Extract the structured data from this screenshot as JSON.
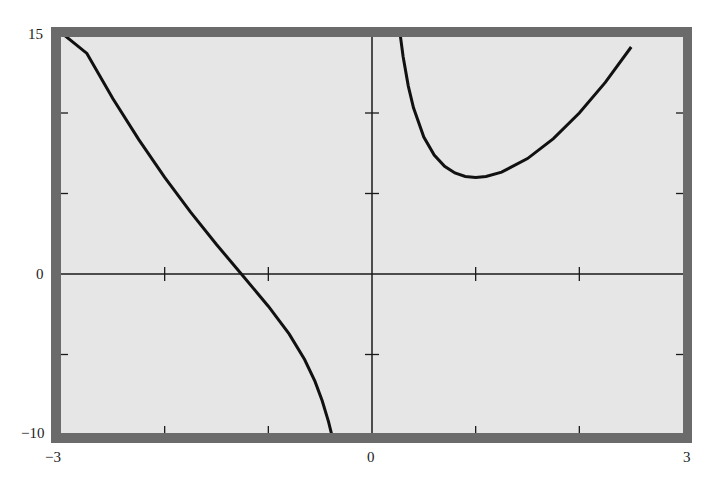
{
  "chart_data": {
    "type": "line",
    "title": "",
    "xlabel": "",
    "ylabel": "",
    "xlim": [
      -3,
      3
    ],
    "ylim": [
      -10,
      15
    ],
    "grid": false,
    "legend": null,
    "x_tick_labels": [
      "-3",
      "0",
      "3"
    ],
    "y_tick_labels": [
      "15",
      "0",
      "-10"
    ],
    "x_minor_ticks": [
      -2,
      -1,
      1,
      2
    ],
    "y_minor_ticks": [
      10,
      5,
      -5
    ],
    "vertical_asymptote": 0,
    "series": [
      {
        "name": "left branch",
        "x": [
          -3.0,
          -2.75,
          -2.5,
          -2.25,
          -2.0,
          -1.75,
          -1.5,
          -1.25,
          -1.0,
          -0.8,
          -0.65,
          -0.55,
          -0.48,
          -0.42,
          -0.38,
          -0.36
        ],
        "y": [
          15.0,
          13.7,
          10.9,
          8.35,
          6.0,
          3.84,
          1.83,
          -0.08,
          -2.0,
          -3.72,
          -5.31,
          -6.67,
          -7.87,
          -9.17,
          -10.2,
          -10.9
        ]
      },
      {
        "name": "right branch",
        "x": [
          0.27,
          0.3,
          0.35,
          0.4,
          0.5,
          0.6,
          0.7,
          0.8,
          0.9,
          1.0,
          1.1,
          1.25,
          1.5,
          1.75,
          2.0,
          2.25,
          2.5
        ],
        "y": [
          14.96,
          13.51,
          11.67,
          10.32,
          8.5,
          7.39,
          6.69,
          6.28,
          6.06,
          6.0,
          6.06,
          6.33,
          7.17,
          8.41,
          10.0,
          11.9,
          14.1
        ]
      }
    ],
    "colors": {
      "frame": "#6b6b6b",
      "plot_background": "#e6e6e6",
      "curve": "#111111",
      "axis": "#1a1a1a"
    }
  },
  "labels": {
    "y_top": "15",
    "y_zero": "0",
    "y_bottom": "−10",
    "x_left": "−3",
    "x_zero": "0",
    "x_right": "3"
  }
}
